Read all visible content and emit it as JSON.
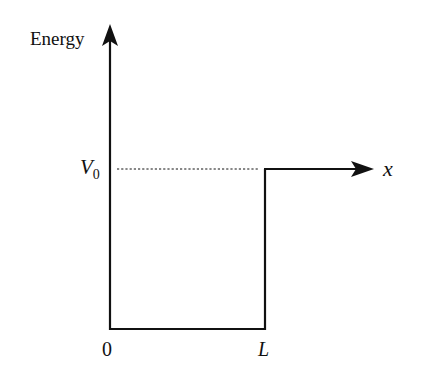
{
  "diagram": {
    "type": "potential-step",
    "y_axis_label": "Energy",
    "x_axis_label": "x",
    "potential_label": "V",
    "potential_subscript": "0",
    "origin_label": "0",
    "width_label": "L",
    "line_color": "#111111",
    "dashed_line": "V0 reference level from x=0 to x=L"
  }
}
